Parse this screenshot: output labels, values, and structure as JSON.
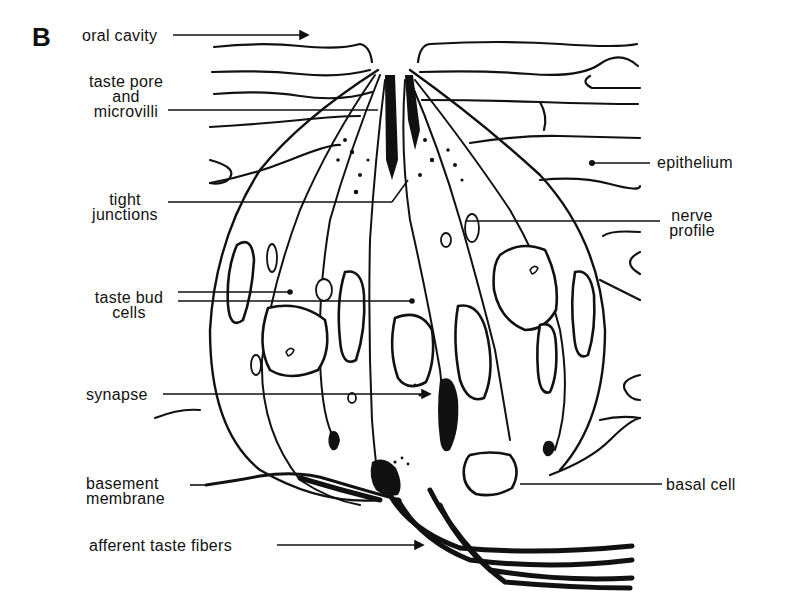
{
  "figure": {
    "panel_letter": "B",
    "colors": {
      "ink": "#111111",
      "background": "#ffffff",
      "stipple": "#222222"
    }
  },
  "labels": {
    "oral_cavity": "oral cavity",
    "taste_pore": {
      "line1": "taste pore",
      "line2": "and",
      "line3": "microvilli"
    },
    "tight_junctions": {
      "line1": "tight",
      "line2": "junctions"
    },
    "taste_bud_cells": {
      "line1": "taste bud",
      "line2": "cells"
    },
    "synapse": "synapse",
    "basement_membrane": {
      "line1": "basement",
      "line2": "membrane"
    },
    "afferent_fibers": "afferent taste fibers",
    "epithelium": "epithelium",
    "nerve_profile": {
      "line1": "nerve",
      "line2": "profile"
    },
    "basal_cell": "basal cell"
  }
}
